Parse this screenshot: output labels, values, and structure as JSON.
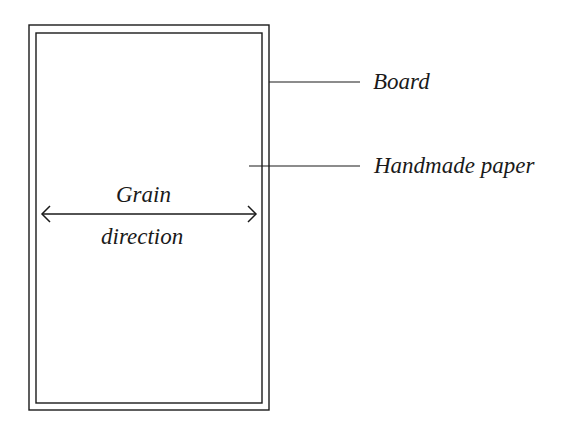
{
  "diagram": {
    "type": "labeled technical illustration",
    "labels": {
      "board": "Board",
      "handmade_paper": "Handmade paper",
      "grain_line1": "Grain",
      "grain_line2": "direction"
    },
    "colors": {
      "line": "#1a1a1a",
      "background": "#ffffff"
    }
  }
}
